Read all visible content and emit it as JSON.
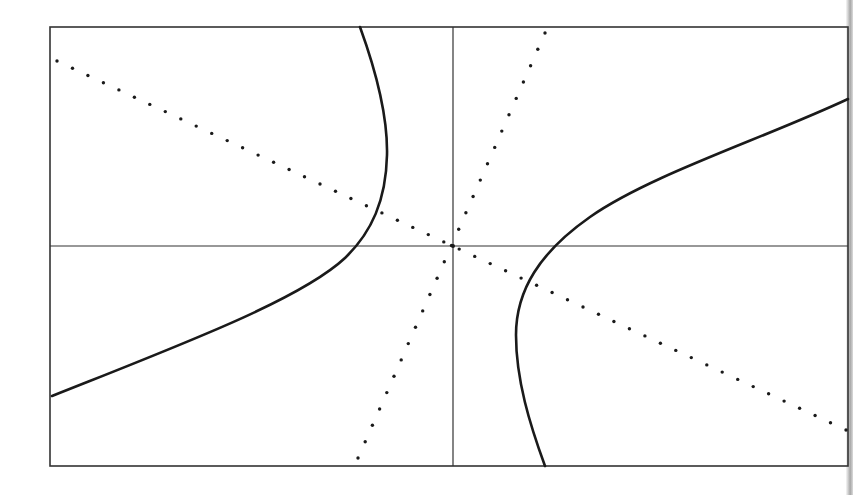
{
  "figure": {
    "colors": {
      "background": "#ffffff",
      "ink": "#1a1a1a",
      "frame": "#333333"
    },
    "frame": {
      "x1": 50,
      "y1": 27,
      "x2": 848,
      "y2": 466
    },
    "axes": {
      "origin_x": 453,
      "origin_y": 246
    },
    "asymptotes": [
      {
        "name": "shallow-asymptote",
        "x1": 57,
        "y1": 61,
        "x2": 846,
        "y2": 430,
        "dot_spacing": 17
      },
      {
        "name": "steep-asymptote",
        "x1": 358,
        "y1": 458,
        "x2": 545,
        "y2": 33,
        "dot_spacing": 18
      }
    ],
    "branches": [
      {
        "name": "left-branch",
        "path": "M360,27 C372,60 388,110 387,155 C386,200 372,232 345,258 C300,300 180,345 52,396"
      },
      {
        "name": "right-branch",
        "path": "M848,99 C760,140 650,175 590,217 C540,252 516,290 516,335 C516,380 530,425 545,466"
      }
    ]
  }
}
